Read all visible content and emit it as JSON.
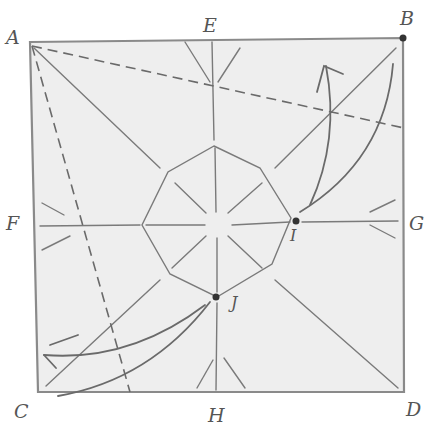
{
  "diagram": {
    "type": "origami crease pattern",
    "paper_color": "#efefef",
    "line_color": "#777777",
    "labels": {
      "A": "A",
      "B": "B",
      "C": "C",
      "D": "D",
      "E": "E",
      "F": "F",
      "G": "G",
      "H": "H",
      "I": "I",
      "J": "J"
    },
    "corners": {
      "A": [
        30,
        42
      ],
      "B": [
        403,
        38
      ],
      "C": [
        38,
        392
      ],
      "D": [
        404,
        392
      ]
    },
    "midpoints": {
      "E": [
        212,
        40
      ],
      "F": [
        34,
        217
      ],
      "G": [
        404,
        220
      ],
      "H": [
        216,
        392
      ]
    },
    "center": [
      217,
      225
    ],
    "marked_points": {
      "I": [
        296,
        221
      ],
      "J": [
        216,
        297
      ]
    }
  }
}
